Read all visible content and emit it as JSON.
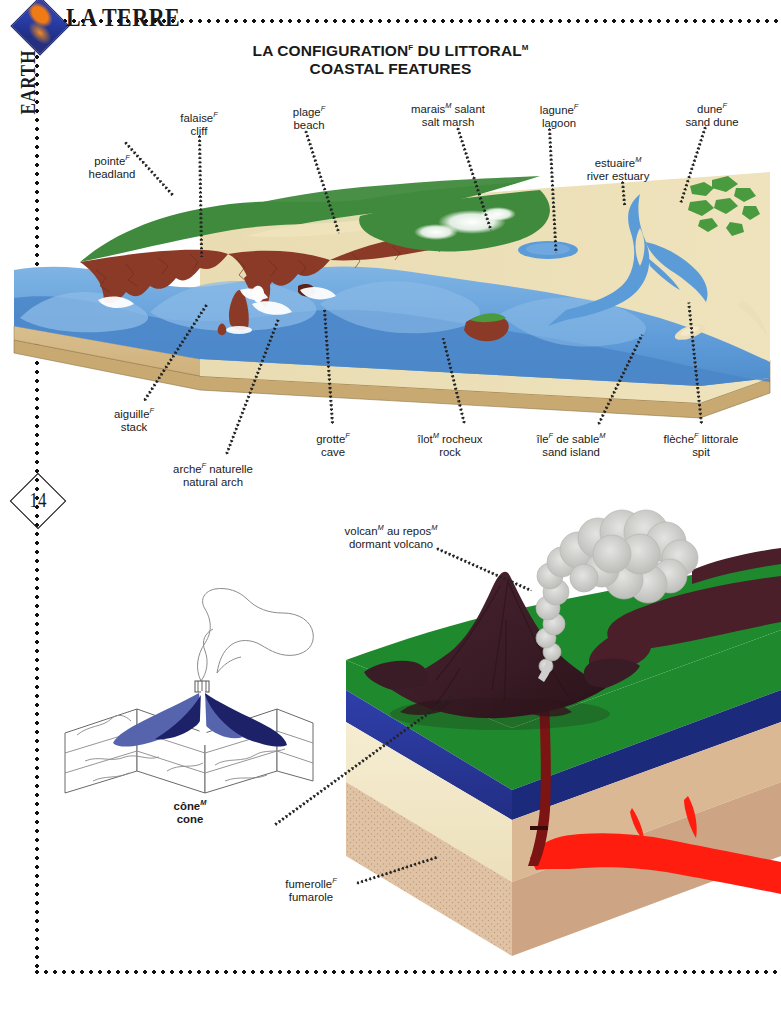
{
  "header": {
    "brand": "LA TERRE",
    "section_tab": "EARTH",
    "logo_icon": "earth-diamond-logo"
  },
  "title": {
    "french": "LA CONFIGURATION",
    "french_gender": "F",
    "french_rest": " DU LITTORAL",
    "french_rest_gender": "M",
    "english": "COASTAL FEATURES"
  },
  "page_number": "14",
  "coastal_labels": [
    {
      "id": "pointe",
      "fr": "pointe",
      "fr_sup": "F",
      "fr_tail": "",
      "en": "headland",
      "x": 112,
      "y": 151
    },
    {
      "id": "falaise",
      "fr": "falaise",
      "fr_sup": "F",
      "fr_tail": "",
      "en": "cliff",
      "x": 199,
      "y": 108
    },
    {
      "id": "plage",
      "fr": "plage",
      "fr_sup": "F",
      "fr_tail": "",
      "en": "beach",
      "x": 309,
      "y": 102
    },
    {
      "id": "marais",
      "fr": "marais",
      "fr_sup": "M",
      "fr_tail": " salant",
      "en": "salt marsh",
      "x": 448,
      "y": 99
    },
    {
      "id": "lagune",
      "fr": "lagune",
      "fr_sup": "F",
      "fr_tail": "",
      "en": "lagoon",
      "x": 559,
      "y": 100
    },
    {
      "id": "estuaire",
      "fr": "estuaire",
      "fr_sup": "M",
      "fr_tail": "",
      "en": "river estuary",
      "x": 618,
      "y": 153
    },
    {
      "id": "dune",
      "fr": "dune",
      "fr_sup": "F",
      "fr_tail": "",
      "en": "sand dune",
      "x": 712,
      "y": 99
    },
    {
      "id": "aiguille",
      "fr": "aiguille",
      "fr_sup": "F",
      "fr_tail": "",
      "en": "stack",
      "x": 134,
      "y": 404
    },
    {
      "id": "arche",
      "fr": "arche",
      "fr_sup": "F",
      "fr_tail": " naturelle",
      "en": "natural arch",
      "x": 213,
      "y": 459
    },
    {
      "id": "grotte",
      "fr": "grotte",
      "fr_sup": "F",
      "fr_tail": "",
      "en": "cave",
      "x": 333,
      "y": 429
    },
    {
      "id": "ilot",
      "fr": "îlot",
      "fr_sup": "M",
      "fr_tail": " rocheux",
      "en": "rock",
      "x": 450,
      "y": 429
    },
    {
      "id": "ile-sable",
      "fr": "île",
      "fr_sup": "F",
      "fr_tail": " de sable",
      "fr_sup2": "M",
      "en": "sand island",
      "x": 571,
      "y": 429
    },
    {
      "id": "fleche",
      "fr": "flèche",
      "fr_sup": "F",
      "fr_tail": " littorale",
      "en": "spit",
      "x": 701,
      "y": 429
    }
  ],
  "volcano_labels": [
    {
      "id": "volcan-repos",
      "fr": "volcan",
      "fr_sup": "M",
      "fr_tail": " au repos",
      "fr_sup2": "M",
      "en": "dormant volcano",
      "x": 391,
      "y": 521
    },
    {
      "id": "fumerolle",
      "fr": "fumerolle",
      "fr_sup": "F",
      "fr_tail": "",
      "en": "fumarole",
      "x": 311,
      "y": 874
    },
    {
      "id": "cone",
      "fr": "cône",
      "fr_sup": "M",
      "fr_tail": "",
      "en": "cone",
      "x": 190,
      "y": 796,
      "bold": true
    }
  ],
  "colors": {
    "grass_green": "#3f8a3c",
    "cliff_brown": "#8a3a26",
    "sand": "#e7dbb4",
    "sea_blue": "#5b9bd8",
    "deep_blue": "#4a86c8",
    "crust_blue": "#2c3a9a",
    "mantle_tan": "#d6ab8a",
    "lava_red": "#ff1d10",
    "volcano_dark": "#3d1f28",
    "smoke_grey": "#cfcfcd",
    "cone_navy": "#1d2268",
    "cone_blue": "#5564ad",
    "page_white": "#ffffff",
    "ink": "#1a1a1a"
  }
}
